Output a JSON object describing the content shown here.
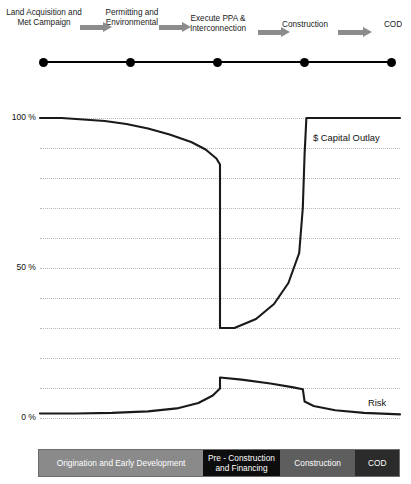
{
  "timeline": {
    "stages": [
      {
        "label": "Land Acquisition and Met Campaign"
      },
      {
        "label": "Permitting and Environmental"
      },
      {
        "label": "Execute PPA & Interconnection"
      },
      {
        "label": "Construction"
      },
      {
        "label": "COD"
      }
    ],
    "arrow_color": "#8c8c8c",
    "node_color": "#000000"
  },
  "chart_data": {
    "type": "line",
    "title": "",
    "xlabel": "",
    "ylabel": "",
    "ylim": [
      0,
      100
    ],
    "ytick_labels": [
      "100 %",
      "50 %",
      "0 %"
    ],
    "ytick_values": [
      100,
      50,
      0
    ],
    "gridlines": [
      100,
      90,
      80,
      70,
      60,
      50,
      40,
      30,
      20,
      10,
      0
    ],
    "grid": true,
    "legend_position": "inline-right",
    "x": [
      0,
      10,
      20,
      30,
      40,
      50,
      60,
      70,
      80,
      90,
      100
    ],
    "series": [
      {
        "name": "$ Capital Outlay",
        "label": "$ Capital Outlay",
        "color": "#1a1a1a",
        "points": [
          [
            0,
            100
          ],
          [
            6,
            100
          ],
          [
            12,
            99.5
          ],
          [
            18,
            99
          ],
          [
            24,
            98
          ],
          [
            30,
            96.5
          ],
          [
            36,
            94.5
          ],
          [
            42,
            92
          ],
          [
            46,
            89.5
          ],
          [
            49,
            86.5
          ],
          [
            50,
            84.5
          ],
          [
            50,
            30
          ],
          [
            54,
            30
          ],
          [
            60,
            33
          ],
          [
            65,
            38
          ],
          [
            69,
            45
          ],
          [
            72,
            55
          ],
          [
            73,
            70
          ],
          [
            73.5,
            88
          ],
          [
            74,
            100
          ],
          [
            86,
            100
          ],
          [
            100,
            100
          ]
        ]
      },
      {
        "name": "Risk",
        "label": "Risk",
        "color": "#1a1a1a",
        "points": [
          [
            0,
            1.5
          ],
          [
            10,
            1.5
          ],
          [
            20,
            1.7
          ],
          [
            30,
            2.2
          ],
          [
            38,
            3.2
          ],
          [
            44,
            5.0
          ],
          [
            48,
            7.5
          ],
          [
            50,
            9.8
          ],
          [
            50,
            13.5
          ],
          [
            56,
            12.8
          ],
          [
            64,
            11.5
          ],
          [
            70,
            10.3
          ],
          [
            73,
            9.6
          ],
          [
            73.5,
            5.5
          ],
          [
            76,
            4.0
          ],
          [
            82,
            2.6
          ],
          [
            90,
            1.7
          ],
          [
            100,
            1.2
          ]
        ]
      }
    ]
  },
  "phase_bar": {
    "segments": [
      {
        "label": "Origination and Early Development",
        "color": "#8a8a8a"
      },
      {
        "label": "Pre - Construction and Financing",
        "color": "#0d0d0d"
      },
      {
        "label": "Construction",
        "color": "#5e5e5e"
      },
      {
        "label": "COD",
        "color": "#2b2b2b"
      }
    ]
  }
}
